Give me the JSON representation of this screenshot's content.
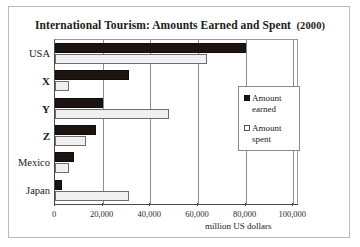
{
  "chart_data": {
    "type": "bar",
    "orientation": "horizontal",
    "title": "International Tourism: Amounts Earned and Spent",
    "title_year": "(2000)",
    "categories": [
      "USA",
      "X",
      "Y",
      "Z",
      "Mexico",
      "Japan"
    ],
    "series": [
      {
        "name": "Amount earned",
        "values": [
          80000,
          31000,
          20000,
          17000,
          8000,
          3000
        ],
        "color": "#1c1410"
      },
      {
        "name": "Amount spent",
        "values": [
          64000,
          6000,
          48000,
          13000,
          6000,
          31000
        ],
        "color": "#f0f0f0"
      }
    ],
    "xlabel": "million US dollars",
    "ylabel": "",
    "xlim": [
      0,
      102000
    ],
    "xticks": [
      0,
      20000,
      40000,
      60000,
      80000,
      100000
    ],
    "xtick_labels": [
      "0",
      "20,000",
      "40,000",
      "60,000",
      "80,000",
      "100,000"
    ],
    "grid": "vertical",
    "legend_position": "center-right",
    "legend_entries": [
      "Amount earned",
      "Amount spent"
    ]
  },
  "axis": {
    "x_title": "million US dollars"
  },
  "legend": {
    "items": [
      {
        "label_line1": "Amount",
        "label_line2": "earned"
      },
      {
        "label_line1": "Amount",
        "label_line2": "spent"
      }
    ]
  }
}
